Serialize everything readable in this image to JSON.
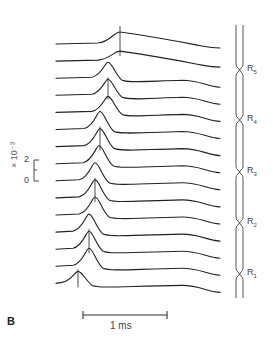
{
  "figure": {
    "panel_label": "B",
    "time_scale_label": "1 ms",
    "amplitude_scale": {
      "unit_label": "× 10⁻³",
      "tick_top": "2",
      "tick_bottom": "0"
    },
    "nodes": [
      {
        "label": "R",
        "sub": "5",
        "y": 70
      },
      {
        "label": "R",
        "sub": "4",
        "y": 120
      },
      {
        "label": "R",
        "sub": "3",
        "y": 172
      },
      {
        "label": "R",
        "sub": "2",
        "y": 223
      },
      {
        "label": "R",
        "sub": "1",
        "y": 274
      }
    ],
    "colors": {
      "trace": "#222222",
      "text": "#444444"
    }
  },
  "chart_data": {
    "type": "line",
    "title": "",
    "xlabel": "time (scale bar 1 ms)",
    "ylabel": "membrane current (×10⁻³)",
    "trace_count": 15,
    "trace_order": "top (near R5) to bottom (near R1)",
    "peak_x_px": [
      120,
      120,
      108,
      108,
      108,
      100,
      100,
      99,
      95,
      95,
      95,
      89,
      89,
      89,
      78
    ],
    "peak_height_px": [
      12,
      10,
      16,
      16,
      16,
      18,
      18,
      18,
      18,
      18,
      18,
      18,
      18,
      18,
      12
    ],
    "nodes": [
      "R1",
      "R2",
      "R3",
      "R4",
      "R5"
    ]
  }
}
